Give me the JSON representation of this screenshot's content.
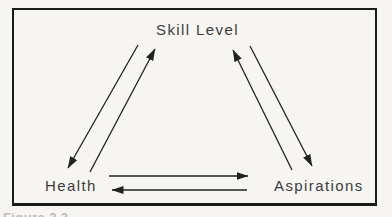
{
  "diagram": {
    "title": "",
    "nodes": {
      "skill_level": {
        "label": "Skill Level"
      },
      "health": {
        "label": "Health"
      },
      "aspirations": {
        "label": "Aspirations"
      }
    },
    "edges": [
      {
        "from": "skill_level",
        "to": "health"
      },
      {
        "from": "health",
        "to": "skill_level"
      },
      {
        "from": "aspirations",
        "to": "skill_level"
      },
      {
        "from": "skill_level",
        "to": "aspirations"
      },
      {
        "from": "health",
        "to": "aspirations"
      },
      {
        "from": "aspirations",
        "to": "health"
      }
    ],
    "caption_fragment": "Figure 2.3"
  },
  "colors": {
    "paper": "#f6f5f1",
    "ink": "#222222",
    "border": "#1b1b1b",
    "label": "#3c3c3c",
    "caption": "#9a9891"
  }
}
